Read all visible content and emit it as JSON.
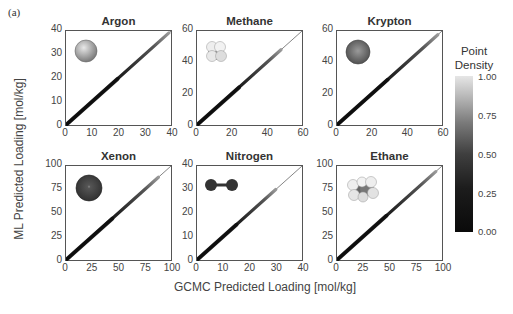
{
  "figure": {
    "panel_label": "(a)",
    "xlabel": "GCMC  Predicted Loading [mol/kg]",
    "ylabel": "ML Predicted Loading [mol/kg]",
    "colorbar": {
      "title_line1": "Point",
      "title_line2": "Density",
      "ticks": [
        "1.00",
        "0.75",
        "0.50",
        "0.25",
        "0.00"
      ]
    }
  },
  "chart_data": [
    {
      "type": "scatter",
      "title": "Argon",
      "molecule_icon": "argon-sphere-icon",
      "xlabel": "GCMC Predicted Loading [mol/kg]",
      "ylabel": "ML Predicted Loading [mol/kg]",
      "xlim": [
        0,
        40
      ],
      "ylim": [
        0,
        40
      ],
      "xticks": [
        "0",
        "10",
        "20",
        "30",
        "40"
      ],
      "yticks": [
        "0",
        "10",
        "20",
        "30",
        "40"
      ],
      "parity_line": true,
      "description": "Dense points along y=x from 0 to ~40"
    },
    {
      "type": "scatter",
      "title": "Methane",
      "molecule_icon": "methane-molecule-icon",
      "xlabel": "GCMC Predicted Loading [mol/kg]",
      "ylabel": "ML Predicted Loading [mol/kg]",
      "xlim": [
        0,
        60
      ],
      "ylim": [
        0,
        60
      ],
      "xticks": [
        "0",
        "20",
        "40",
        "60"
      ],
      "yticks": [
        "0",
        "20",
        "40",
        "60"
      ],
      "parity_line": true,
      "description": "Dense points along y=x from 0 to ~48"
    },
    {
      "type": "scatter",
      "title": "Krypton",
      "molecule_icon": "krypton-sphere-icon",
      "xlabel": "GCMC Predicted Loading [mol/kg]",
      "ylabel": "ML Predicted Loading [mol/kg]",
      "xlim": [
        0,
        60
      ],
      "ylim": [
        0,
        60
      ],
      "xticks": [
        "0",
        "20",
        "40",
        "60"
      ],
      "yticks": [
        "0",
        "20",
        "40",
        "60"
      ],
      "parity_line": true,
      "description": "Dense points along y=x from 0 to ~58"
    },
    {
      "type": "scatter",
      "title": "Xenon",
      "molecule_icon": "xenon-sphere-icon",
      "xlabel": "GCMC Predicted Loading [mol/kg]",
      "ylabel": "ML Predicted Loading [mol/kg]",
      "xlim": [
        0,
        100
      ],
      "ylim": [
        0,
        100
      ],
      "xticks": [
        "0",
        "25",
        "50",
        "75",
        "100"
      ],
      "yticks": [
        "0",
        "25",
        "50",
        "75",
        "100"
      ],
      "parity_line": true,
      "description": "Dense points along y=x from 0 to ~90"
    },
    {
      "type": "scatter",
      "title": "Nitrogen",
      "molecule_icon": "nitrogen-molecule-icon",
      "xlabel": "GCMC Predicted Loading [mol/kg]",
      "ylabel": "ML Predicted Loading [mol/kg]",
      "xlim": [
        0,
        40
      ],
      "ylim": [
        0,
        40
      ],
      "xticks": [
        "0",
        "10",
        "20",
        "30",
        "40"
      ],
      "yticks": [
        "0",
        "10",
        "20",
        "30",
        "40"
      ],
      "parity_line": true,
      "description": "Dense points along y=x from 0 to ~30"
    },
    {
      "type": "scatter",
      "title": "Ethane",
      "molecule_icon": "ethane-molecule-icon",
      "xlabel": "GCMC Predicted Loading [mol/kg]",
      "ylabel": "ML Predicted Loading [mol/kg]",
      "xlim": [
        0,
        100
      ],
      "ylim": [
        0,
        100
      ],
      "xticks": [
        "0",
        "25",
        "50",
        "75",
        "100"
      ],
      "yticks": [
        "0",
        "25",
        "50",
        "75",
        "100"
      ],
      "parity_line": true,
      "description": "Dense points along y=x from 0 to ~95"
    }
  ]
}
